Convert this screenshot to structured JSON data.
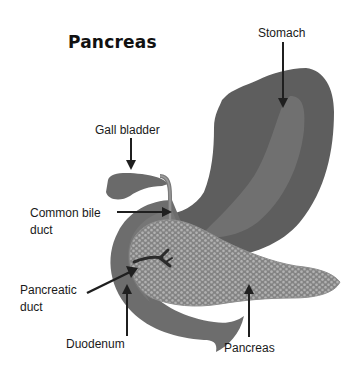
{
  "title": "Pancreas",
  "labels": {
    "stomach": "Stomach",
    "gall_bladder": "Gall bladder",
    "common_bile_duct": "Common bile\nduct",
    "pancreatic_duct": "Pancreatic\nduct",
    "duodenum": "Duodenum",
    "pancreas": "Pancreas"
  },
  "colors": {
    "background": "#ffffff",
    "organ_dark": "#5e5e5e",
    "organ_light": "#717171",
    "duodenum": "#6d6d6d",
    "pancreas_tissue": "#8a8a8a",
    "pancreas_cells": "#b4b4b4",
    "duct": "#2b2b2b",
    "arrow": "#1f1f1f",
    "text": "#1a1a1a"
  }
}
